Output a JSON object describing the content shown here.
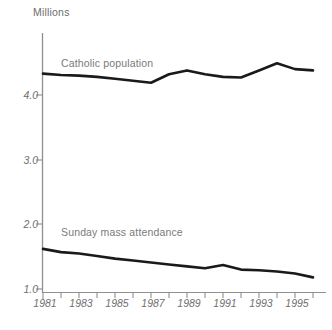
{
  "chart_data": {
    "type": "line",
    "title": "",
    "subtitle": "",
    "ylabel": "Millions",
    "xlabel": "",
    "grid": false,
    "legend_position": "inline-annotations",
    "x": [
      1981,
      1982,
      1983,
      1984,
      1985,
      1986,
      1987,
      1988,
      1989,
      1990,
      1991,
      1992,
      1993,
      1994,
      1995,
      1996
    ],
    "xticklabels": [
      "1981",
      "",
      "1983",
      "",
      "1985",
      "",
      "1987",
      "",
      "1989",
      "",
      "1991",
      "",
      "1993",
      "",
      "1995",
      ""
    ],
    "xticklabels_shown": [
      "1981",
      "1983",
      "1985",
      "1987",
      "1989",
      "1991",
      "1993",
      "1995"
    ],
    "yticklabels": [
      "1.0",
      "2.0",
      "3.0",
      "4.0"
    ],
    "yticks": [
      1.0,
      2.0,
      3.0,
      4.0
    ],
    "ylim": [
      0.85,
      4.95
    ],
    "xlim": [
      1981,
      1996
    ],
    "series": [
      {
        "name": "Catholic population",
        "color": "#1a1a1a",
        "values": [
          4.33,
          4.31,
          4.3,
          4.28,
          4.25,
          4.22,
          4.19,
          4.32,
          4.38,
          4.32,
          4.28,
          4.27,
          4.38,
          4.49,
          4.4,
          4.38
        ]
      },
      {
        "name": "Sunday mass attendance",
        "color": "#1a1a1a",
        "values": [
          1.62,
          1.57,
          1.55,
          1.51,
          1.47,
          1.44,
          1.41,
          1.38,
          1.35,
          1.32,
          1.37,
          1.3,
          1.29,
          1.27,
          1.24,
          1.18
        ]
      }
    ],
    "annotations": [
      {
        "text": "Catholic population",
        "x": 1982.7,
        "y": 4.52
      },
      {
        "text": "Sunday mass attendance",
        "x": 1982.7,
        "y": 1.86
      }
    ]
  },
  "axes": {
    "y_axis_title": "Millions",
    "axis_color": "#909090",
    "line_color": "#1a1a1a",
    "tick_label_color": "#6f6f6f"
  },
  "labels": {
    "series_catholic": "Catholic population",
    "series_sunday": "Sunday mass attendance",
    "ytick_1": "1.0",
    "ytick_2": "2.0",
    "ytick_3": "3.0",
    "ytick_4": "4.0",
    "xtick_1981": "1981",
    "xtick_1983": "1983",
    "xtick_1985": "1985",
    "xtick_1987": "1987",
    "xtick_1989": "1989",
    "xtick_1991": "1991",
    "xtick_1993": "1993",
    "xtick_1995": "1995"
  },
  "source_caption": ""
}
